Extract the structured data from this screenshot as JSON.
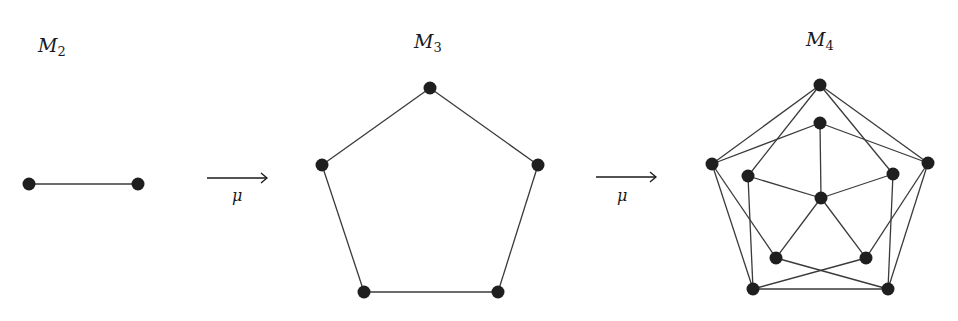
{
  "graphs": [
    {
      "id": "m2",
      "title": "M",
      "subscript": "2",
      "title_pos": [
        38,
        52
      ],
      "nodes": [
        [
          29,
          184
        ],
        [
          138,
          184
        ]
      ],
      "edges": [
        [
          0,
          1
        ]
      ]
    },
    {
      "id": "m3",
      "title": "M",
      "subscript": "3",
      "title_pos": [
        414,
        48
      ],
      "nodes": [
        [
          430,
          88
        ],
        [
          538,
          165
        ],
        [
          498,
          292
        ],
        [
          364,
          292
        ],
        [
          322,
          165
        ]
      ],
      "edges": [
        [
          0,
          1
        ],
        [
          1,
          2
        ],
        [
          2,
          3
        ],
        [
          3,
          4
        ],
        [
          4,
          0
        ]
      ]
    },
    {
      "id": "m4",
      "title": "M",
      "subscript": "4",
      "title_pos": [
        806,
        46
      ],
      "nodes": [
        [
          820,
          85
        ],
        [
          928,
          163
        ],
        [
          888,
          289
        ],
        [
          753,
          289
        ],
        [
          712,
          164
        ],
        [
          820,
          123
        ],
        [
          893,
          174
        ],
        [
          866,
          258
        ],
        [
          776,
          258
        ],
        [
          748,
          176
        ],
        [
          821,
          198
        ]
      ],
      "edges": [
        [
          0,
          1
        ],
        [
          1,
          2
        ],
        [
          2,
          3
        ],
        [
          3,
          4
        ],
        [
          4,
          0
        ],
        [
          5,
          1
        ],
        [
          5,
          4
        ],
        [
          6,
          0
        ],
        [
          6,
          2
        ],
        [
          7,
          1
        ],
        [
          7,
          3
        ],
        [
          8,
          2
        ],
        [
          8,
          4
        ],
        [
          9,
          3
        ],
        [
          9,
          0
        ],
        [
          10,
          5
        ],
        [
          10,
          6
        ],
        [
          10,
          7
        ],
        [
          10,
          8
        ],
        [
          10,
          9
        ]
      ]
    }
  ],
  "arrows": [
    {
      "label": "μ",
      "x1": 207,
      "x2": 267,
      "y": 178,
      "label_pos": [
        232,
        201
      ]
    },
    {
      "label": "μ",
      "x1": 596,
      "x2": 656,
      "y": 177,
      "label_pos": [
        617,
        201
      ]
    }
  ],
  "style": {
    "node_radius": 6.5,
    "node_color": "#1f1f1f",
    "edge_color": "#3a3a3a"
  }
}
